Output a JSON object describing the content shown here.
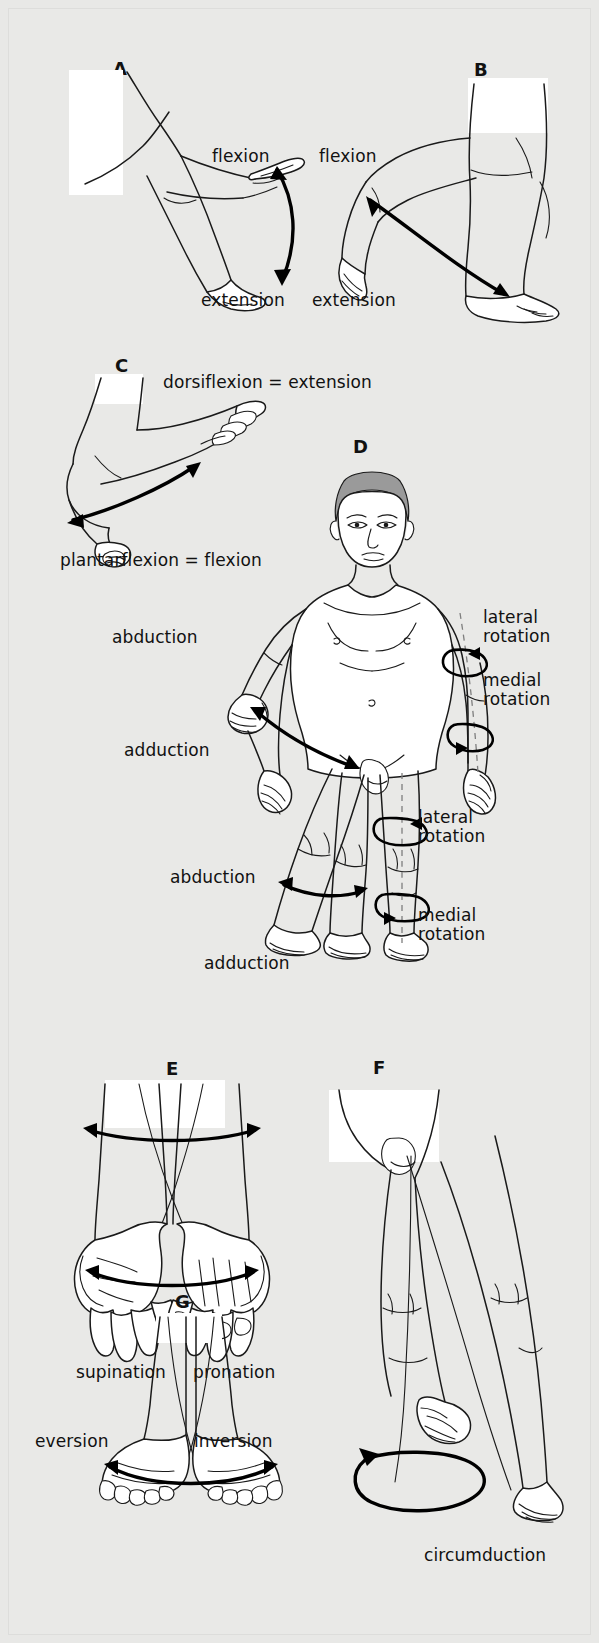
{
  "figure": {
    "background_color": "#e8e8e6",
    "ink_color": "#1a1a1a",
    "hair_color": "#9a9a9a"
  },
  "panels": [
    {
      "id": "A",
      "letter": "A",
      "subject": "elbow",
      "labels": [
        {
          "key": "flexion",
          "text": "flexion"
        },
        {
          "key": "extension",
          "text": "extension"
        }
      ]
    },
    {
      "id": "B",
      "letter": "B",
      "subject": "knee",
      "labels": [
        {
          "key": "flexion",
          "text": "flexion"
        },
        {
          "key": "extension",
          "text": "extension"
        }
      ]
    },
    {
      "id": "C",
      "letter": "C",
      "subject": "ankle",
      "labels": [
        {
          "key": "dorsiflexion",
          "text": "dorsiflexion = extension"
        },
        {
          "key": "plantarflexion",
          "text": "plantarflexion = flexion"
        }
      ]
    },
    {
      "id": "D",
      "letter": "D",
      "subject": "whole-body",
      "labels": [
        {
          "key": "shoulder_abduction",
          "text": "abduction"
        },
        {
          "key": "shoulder_adduction",
          "text": "adduction"
        },
        {
          "key": "arm_lateral_rotation",
          "text": "lateral\nrotation"
        },
        {
          "key": "arm_medial_rotation",
          "text": "medial\nrotation"
        },
        {
          "key": "leg_lateral_rotation",
          "text": "lateral\nrotation"
        },
        {
          "key": "leg_medial_rotation",
          "text": "medial\nrotation"
        },
        {
          "key": "hip_abduction",
          "text": "abduction"
        },
        {
          "key": "hip_adduction",
          "text": "adduction"
        }
      ]
    },
    {
      "id": "E",
      "letter": "E",
      "subject": "forearm-hands",
      "labels": [
        {
          "key": "supination",
          "text": "supination"
        },
        {
          "key": "pronation",
          "text": "pronation"
        }
      ]
    },
    {
      "id": "F",
      "letter": "F",
      "subject": "hip-leg",
      "labels": [
        {
          "key": "circumduction",
          "text": "circumduction"
        }
      ]
    },
    {
      "id": "G",
      "letter": "G",
      "subject": "feet",
      "labels": [
        {
          "key": "eversion",
          "text": "eversion"
        },
        {
          "key": "inversion",
          "text": "inversion"
        }
      ]
    }
  ]
}
